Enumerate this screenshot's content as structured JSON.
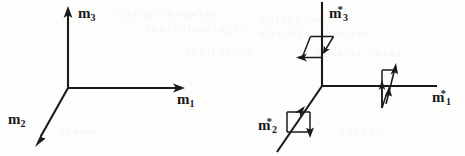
{
  "figure": {
    "background_color": "#fdfdfc",
    "ink_color": "#1a1a1a",
    "panels": [
      {
        "id": "left-frame",
        "name": "reference-frame",
        "origin": {
          "x": 68,
          "y": 88
        },
        "axes": [
          {
            "name": "m1",
            "label": "m",
            "subscript": "1",
            "superscript": "",
            "direction": "right",
            "tip": {
              "x": 183,
              "y": 88
            },
            "arrowhead": true,
            "label_pos": {
              "x": 178,
              "y": 92
            }
          },
          {
            "name": "m2",
            "label": "m",
            "subscript": "2",
            "superscript": "",
            "direction": "down-left",
            "tip": {
              "x": 36,
              "y": 143
            },
            "arrowhead": true,
            "label_pos": {
              "x": 8,
              "y": 112
            }
          },
          {
            "name": "m3",
            "label": "m",
            "subscript": "3",
            "superscript": "",
            "direction": "up",
            "tip": {
              "x": 68,
              "y": 8
            },
            "arrowhead": true,
            "label_pos": {
              "x": 78,
              "y": 6
            }
          }
        ]
      },
      {
        "id": "right-frame",
        "name": "perturbed-frame",
        "origin": {
          "x": 322,
          "y": 86
        },
        "axes": [
          {
            "name": "m1-star",
            "label": "m",
            "subscript": "1",
            "superscript": "*",
            "direction": "right",
            "tip": {
              "x": 437,
              "y": 86
            },
            "arrowhead": false,
            "label_pos": {
              "x": 432,
              "y": 90
            },
            "decoration": "parallelogram-up-right"
          },
          {
            "name": "m2-star",
            "label": "m",
            "subscript": "2",
            "superscript": "*",
            "direction": "down-left",
            "tip": {
              "x": 278,
              "y": 150
            },
            "arrowhead": false,
            "label_pos": {
              "x": 258,
              "y": 118
            },
            "decoration": "rectangle-down"
          },
          {
            "name": "m3-star",
            "label": "m",
            "subscript": "3",
            "superscript": "*",
            "direction": "up",
            "tip": {
              "x": 322,
              "y": 2
            },
            "arrowhead": false,
            "label_pos": {
              "x": 330,
              "y": 5
            },
            "decoration": "parallelogram-down-left"
          }
        ]
      }
    ],
    "ghost_text": [
      {
        "text": "t  u  s   t h  a  t  t h e   d e f  o r",
        "x": 113,
        "y": 14,
        "size": 11
      },
      {
        "text": "t h e   f o l l o w i n g   i s",
        "x": 146,
        "y": 29,
        "size": 11
      },
      {
        "text": "r e  f  .   ( 3 )  ,   t  h",
        "x": 186,
        "y": 50,
        "size": 11
      },
      {
        "text": "n o t   t h e   s  a m",
        "x": 260,
        "y": 18,
        "size": 11
      },
      {
        "text": "w h i c h   f o r   t h  e   c a s e",
        "x": 258,
        "y": 32,
        "size": 11
      },
      {
        "text": "d e t a i l s ,  i n  t h e",
        "x": 316,
        "y": 53,
        "size": 11
      },
      {
        "text": "f  r  a  m  e",
        "x": 60,
        "y": 130,
        "size": 11
      },
      {
        "text": "s  o   t h  a  t",
        "x": 340,
        "y": 130,
        "size": 11
      }
    ]
  }
}
